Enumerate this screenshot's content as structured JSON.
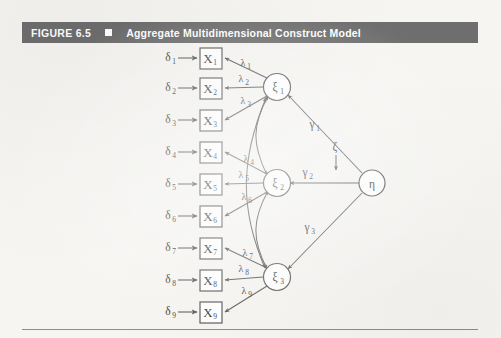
{
  "figure": {
    "number": "FIGURE 6.5",
    "separator_icon": "filled-square-icon",
    "title": "Aggregate Multidimensional Construct Model"
  },
  "colors": {
    "header_bar": "#6e6e6e",
    "header_text": "#ffffff",
    "page_background": "#f6f5f2",
    "stroke": "#595959",
    "node_fill": "#ffffff",
    "rule": "#8d8d8d"
  },
  "diagram": {
    "type": "structural-equation-model-path-diagram",
    "errors": [
      {
        "label": "δ",
        "sub": "1"
      },
      {
        "label": "δ",
        "sub": "2"
      },
      {
        "label": "δ",
        "sub": "3"
      },
      {
        "label": "δ",
        "sub": "4"
      },
      {
        "label": "δ",
        "sub": "5"
      },
      {
        "label": "δ",
        "sub": "6"
      },
      {
        "label": "δ",
        "sub": "7"
      },
      {
        "label": "δ",
        "sub": "8"
      },
      {
        "label": "δ",
        "sub": "9"
      }
    ],
    "indicators": [
      {
        "label": "X",
        "sub": "1"
      },
      {
        "label": "X",
        "sub": "2"
      },
      {
        "label": "X",
        "sub": "3"
      },
      {
        "label": "X",
        "sub": "4"
      },
      {
        "label": "X",
        "sub": "5"
      },
      {
        "label": "X",
        "sub": "6"
      },
      {
        "label": "X",
        "sub": "7"
      },
      {
        "label": "X",
        "sub": "8"
      },
      {
        "label": "X",
        "sub": "9"
      }
    ],
    "loadings": [
      {
        "label": "λ",
        "sub": "1"
      },
      {
        "label": "λ",
        "sub": "2"
      },
      {
        "label": "λ",
        "sub": "3"
      },
      {
        "label": "λ",
        "sub": "4"
      },
      {
        "label": "λ",
        "sub": "5"
      },
      {
        "label": "λ",
        "sub": "6"
      },
      {
        "label": "λ",
        "sub": "7"
      },
      {
        "label": "λ",
        "sub": "8"
      },
      {
        "label": "λ",
        "sub": "9"
      }
    ],
    "dimensions": [
      {
        "label": "ξ",
        "sub": "1"
      },
      {
        "label": "ξ",
        "sub": "2"
      },
      {
        "label": "ξ",
        "sub": "3"
      }
    ],
    "paths": [
      {
        "label": "γ",
        "sub": "1"
      },
      {
        "label": "γ",
        "sub": "2"
      },
      {
        "label": "γ",
        "sub": "3"
      }
    ],
    "latent": {
      "label": "η",
      "sub": ""
    },
    "disturbance": {
      "label": "ζ",
      "sub": ""
    }
  }
}
